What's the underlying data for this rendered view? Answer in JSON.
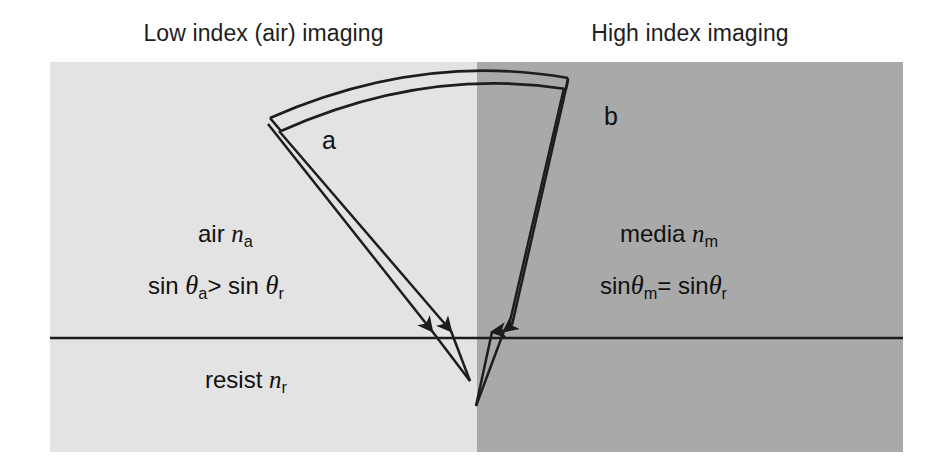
{
  "figure": {
    "headings": {
      "left": "Low index (air) imaging",
      "right": "High index imaging"
    },
    "panel_letters": {
      "left": "a",
      "right": "b"
    },
    "labels": {
      "air_medium": "air",
      "air_index_symbol": "n",
      "air_index_subscript": "a",
      "media_medium": "media",
      "media_index_symbol": "n",
      "media_index_subscript": "m",
      "resist_medium": "resist",
      "resist_index_symbol": "n",
      "resist_index_subscript": "r",
      "sin_text": "sin",
      "theta_symbol": "θ",
      "air_relation": {
        "left_subscript": "a",
        "operator": ">",
        "right_subscript": "r"
      },
      "media_relation": {
        "left_subscript": "m",
        "operator": "=",
        "right_subscript": "r"
      }
    },
    "colors": {
      "low_index_panel": "#e3e3e3",
      "high_index_panel": "#a9a9a9",
      "ink": "#1d1d1d",
      "page_background": "#ffffff"
    },
    "geometry": {
      "panel_top": 62,
      "panel_bottom": 452,
      "panel_left": 50,
      "panel_right": 903,
      "divider_x": 477,
      "resist_interface_y": 338,
      "lens_left_x": 270,
      "lens_right_x": 568,
      "lens_apex_y": 62,
      "air_focus": {
        "x": 470,
        "y": 381
      },
      "media_focus": {
        "x": 476,
        "y": 406
      }
    }
  }
}
